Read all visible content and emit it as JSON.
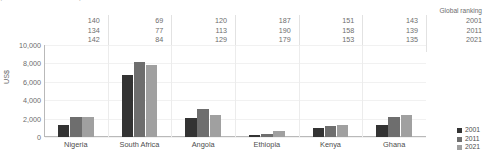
{
  "caption": {
    "text": "(Trade in millions of US dollars)"
  },
  "ranking": {
    "title": "Global ranking",
    "years": [
      "2001",
      "2011",
      "2021"
    ],
    "columns": [
      {
        "country": "Nigeria",
        "values": [
          "140",
          "134",
          "142"
        ]
      },
      {
        "country": "South Africa",
        "values": [
          "69",
          "77",
          "84"
        ]
      },
      {
        "country": "Angola",
        "values": [
          "120",
          "113",
          "129"
        ]
      },
      {
        "country": "Ethiopia",
        "values": [
          "187",
          "190",
          "179"
        ]
      },
      {
        "country": "Kenya",
        "values": [
          "151",
          "158",
          "153"
        ]
      },
      {
        "country": "Ghana",
        "values": [
          "143",
          "139",
          "135"
        ]
      }
    ]
  },
  "legend": {
    "items": [
      {
        "label": "2001",
        "color": "#333333"
      },
      {
        "label": "2011",
        "color": "#6e6e6e"
      },
      {
        "label": "2021",
        "color": "#a0a0a0"
      }
    ]
  },
  "axis": {
    "y_title": "US$",
    "y_ticks": [
      "10,000",
      "8,000",
      "6,000",
      "4,000",
      "2,000",
      "0"
    ]
  },
  "chart_data": {
    "type": "bar",
    "title": "",
    "subtitle": "",
    "xlabel": "",
    "ylabel": "US$",
    "ylim": [
      0,
      10000
    ],
    "ytick_step": 2000,
    "grid": true,
    "legend_position": "bottom-right",
    "categories": [
      "Nigeria",
      "South Africa",
      "Angola",
      "Ethiopia",
      "Kenya",
      "Ghana"
    ],
    "series": [
      {
        "name": "2001",
        "color": "#333333",
        "values": [
          1300,
          6700,
          2050,
          200,
          1000,
          1350
        ]
      },
      {
        "name": "2011",
        "color": "#6e6e6e",
        "values": [
          2200,
          8200,
          3000,
          350,
          1250,
          2150
        ]
      },
      {
        "name": "2021",
        "color": "#a0a0a0",
        "values": [
          2150,
          7800,
          2400,
          600,
          1350,
          2400
        ]
      }
    ],
    "annotations": {
      "label": "Global ranking",
      "rows": [
        "2001",
        "2011",
        "2021"
      ],
      "values": {
        "Nigeria": [
          140,
          134,
          142
        ],
        "South Africa": [
          69,
          77,
          84
        ],
        "Angola": [
          120,
          113,
          129
        ],
        "Ethiopia": [
          187,
          190,
          179
        ],
        "Kenya": [
          151,
          158,
          153
        ],
        "Ghana": [
          143,
          139,
          135
        ]
      }
    }
  }
}
